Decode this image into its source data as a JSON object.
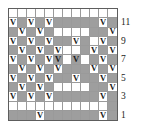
{
  "chart_data": {
    "type": "heatmap",
    "title": "",
    "xlabel": "",
    "ylabel": "",
    "columns": 12,
    "rows": 12,
    "legend": [],
    "colors": {
      "filled": "#9e9e9e",
      "empty": "#ffffff",
      "grid_line": "#9a9a9a",
      "border": "#5d5d5d",
      "symbol": "#1a1a1a"
    },
    "symbol_glyph": "V",
    "row_labels_side": "right",
    "row_labels": [
      {
        "row": 11,
        "text": "11"
      },
      {
        "row": 9,
        "text": "9"
      },
      {
        "row": 7,
        "text": "7"
      },
      {
        "row": 5,
        "text": "5"
      },
      {
        "row": 3,
        "text": "3"
      },
      {
        "row": 1,
        "text": "1"
      }
    ],
    "cell_legend": {
      "g": "filled-gray",
      "w": "empty-white",
      "v": "V stitch symbol"
    },
    "grid": [
      {
        "row": 12,
        "cells": [
          {
            "f": "w",
            "v": false
          },
          {
            "f": "w",
            "v": false
          },
          {
            "f": "w",
            "v": false
          },
          {
            "f": "w",
            "v": false
          },
          {
            "f": "w",
            "v": false
          },
          {
            "f": "w",
            "v": false
          },
          {
            "f": "w",
            "v": false
          },
          {
            "f": "w",
            "v": false
          },
          {
            "f": "w",
            "v": false
          },
          {
            "f": "w",
            "v": false
          },
          {
            "f": "w",
            "v": false
          },
          {
            "f": "w",
            "v": false
          }
        ]
      },
      {
        "row": 11,
        "cells": [
          {
            "f": "w",
            "v": true
          },
          {
            "f": "g",
            "v": false
          },
          {
            "f": "w",
            "v": true
          },
          {
            "f": "g",
            "v": false
          },
          {
            "f": "w",
            "v": true
          },
          {
            "f": "g",
            "v": false
          },
          {
            "f": "g",
            "v": false
          },
          {
            "f": "g",
            "v": false
          },
          {
            "f": "g",
            "v": false
          },
          {
            "f": "g",
            "v": false
          },
          {
            "f": "w",
            "v": true
          },
          {
            "f": "g",
            "v": false
          }
        ]
      },
      {
        "row": 10,
        "cells": [
          {
            "f": "g",
            "v": false
          },
          {
            "f": "w",
            "v": true
          },
          {
            "f": "g",
            "v": false
          },
          {
            "f": "w",
            "v": true
          },
          {
            "f": "g",
            "v": false
          },
          {
            "f": "w",
            "v": false
          },
          {
            "f": "w",
            "v": false
          },
          {
            "f": "w",
            "v": false
          },
          {
            "f": "w",
            "v": false
          },
          {
            "f": "g",
            "v": false
          },
          {
            "f": "g",
            "v": false
          },
          {
            "f": "w",
            "v": true
          }
        ]
      },
      {
        "row": 9,
        "cells": [
          {
            "f": "w",
            "v": true
          },
          {
            "f": "g",
            "v": false
          },
          {
            "f": "w",
            "v": true
          },
          {
            "f": "g",
            "v": false
          },
          {
            "f": "w",
            "v": true
          },
          {
            "f": "g",
            "v": false
          },
          {
            "f": "g",
            "v": false
          },
          {
            "f": "w",
            "v": true
          },
          {
            "f": "g",
            "v": false
          },
          {
            "f": "w",
            "v": false
          },
          {
            "f": "w",
            "v": true
          },
          {
            "f": "g",
            "v": false
          }
        ]
      },
      {
        "row": 8,
        "cells": [
          {
            "f": "g",
            "v": false
          },
          {
            "f": "w",
            "v": true
          },
          {
            "f": "g",
            "v": false
          },
          {
            "f": "w",
            "v": true
          },
          {
            "f": "g",
            "v": false
          },
          {
            "f": "w",
            "v": true
          },
          {
            "f": "w",
            "v": false
          },
          {
            "f": "w",
            "v": false
          },
          {
            "f": "g",
            "v": false
          },
          {
            "f": "w",
            "v": true
          },
          {
            "f": "g",
            "v": false
          },
          {
            "f": "w",
            "v": true
          }
        ]
      },
      {
        "row": 7,
        "cells": [
          {
            "f": "w",
            "v": true
          },
          {
            "f": "g",
            "v": false
          },
          {
            "f": "w",
            "v": true
          },
          {
            "f": "g",
            "v": false
          },
          {
            "f": "w",
            "v": true
          },
          {
            "f": "g",
            "v": true
          },
          {
            "f": "w",
            "v": false
          },
          {
            "f": "g",
            "v": true
          },
          {
            "f": "w",
            "v": false
          },
          {
            "f": "g",
            "v": false
          },
          {
            "f": "w",
            "v": true
          },
          {
            "f": "g",
            "v": false
          }
        ]
      },
      {
        "row": 6,
        "cells": [
          {
            "f": "g",
            "v": false
          },
          {
            "f": "w",
            "v": true
          },
          {
            "f": "g",
            "v": false
          },
          {
            "f": "w",
            "v": true
          },
          {
            "f": "g",
            "v": false
          },
          {
            "f": "w",
            "v": true
          },
          {
            "f": "g",
            "v": false
          },
          {
            "f": "g",
            "v": false
          },
          {
            "f": "g",
            "v": false
          },
          {
            "f": "w",
            "v": true
          },
          {
            "f": "g",
            "v": false
          },
          {
            "f": "w",
            "v": true
          }
        ]
      },
      {
        "row": 5,
        "cells": [
          {
            "f": "w",
            "v": true
          },
          {
            "f": "g",
            "v": false
          },
          {
            "f": "w",
            "v": true
          },
          {
            "f": "g",
            "v": false
          },
          {
            "f": "w",
            "v": true
          },
          {
            "f": "g",
            "v": false
          },
          {
            "f": "g",
            "v": false
          },
          {
            "f": "w",
            "v": true
          },
          {
            "f": "g",
            "v": false
          },
          {
            "f": "g",
            "v": false
          },
          {
            "f": "w",
            "v": true
          },
          {
            "f": "g",
            "v": false
          }
        ]
      },
      {
        "row": 4,
        "cells": [
          {
            "f": "g",
            "v": false
          },
          {
            "f": "w",
            "v": true
          },
          {
            "f": "g",
            "v": false
          },
          {
            "f": "w",
            "v": true
          },
          {
            "f": "g",
            "v": false
          },
          {
            "f": "w",
            "v": false
          },
          {
            "f": "w",
            "v": false
          },
          {
            "f": "w",
            "v": false
          },
          {
            "f": "w",
            "v": false
          },
          {
            "f": "g",
            "v": false
          },
          {
            "f": "g",
            "v": false
          },
          {
            "f": "w",
            "v": true
          }
        ]
      },
      {
        "row": 3,
        "cells": [
          {
            "f": "w",
            "v": true
          },
          {
            "f": "g",
            "v": false
          },
          {
            "f": "w",
            "v": true
          },
          {
            "f": "g",
            "v": false
          },
          {
            "f": "w",
            "v": true
          },
          {
            "f": "g",
            "v": false
          },
          {
            "f": "g",
            "v": false
          },
          {
            "f": "g",
            "v": false
          },
          {
            "f": "g",
            "v": false
          },
          {
            "f": "g",
            "v": false
          },
          {
            "f": "w",
            "v": true
          },
          {
            "f": "g",
            "v": false
          }
        ]
      },
      {
        "row": 2,
        "cells": [
          {
            "f": "w",
            "v": false
          },
          {
            "f": "w",
            "v": false
          },
          {
            "f": "w",
            "v": false
          },
          {
            "f": "w",
            "v": false
          },
          {
            "f": "w",
            "v": false
          },
          {
            "f": "w",
            "v": false
          },
          {
            "f": "w",
            "v": false
          },
          {
            "f": "w",
            "v": false
          },
          {
            "f": "w",
            "v": false
          },
          {
            "f": "w",
            "v": false
          },
          {
            "f": "w",
            "v": false
          },
          {
            "f": "g",
            "v": false
          }
        ]
      },
      {
        "row": 1,
        "cells": [
          {
            "f": "g",
            "v": false
          },
          {
            "f": "g",
            "v": false
          },
          {
            "f": "g",
            "v": false
          },
          {
            "f": "w",
            "v": true
          },
          {
            "f": "g",
            "v": false
          },
          {
            "f": "g",
            "v": false
          },
          {
            "f": "g",
            "v": false
          },
          {
            "f": "g",
            "v": false
          },
          {
            "f": "g",
            "v": false
          },
          {
            "f": "g",
            "v": false
          },
          {
            "f": "w",
            "v": true
          },
          {
            "f": "g",
            "v": false
          }
        ]
      }
    ]
  }
}
